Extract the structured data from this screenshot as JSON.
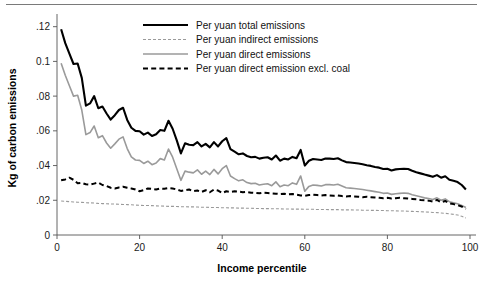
{
  "figure": {
    "has_top_rule": true,
    "background": "#ffffff"
  },
  "chart_data": {
    "type": "line",
    "title": "",
    "xlabel": "Income percentile",
    "ylabel": "Kg of carbon emissions",
    "xlim": [
      0,
      100
    ],
    "ylim": [
      0,
      0.125
    ],
    "grid": false,
    "legend_position": "top-center",
    "xticks": [
      0,
      20,
      40,
      60,
      80,
      100
    ],
    "xtick_labels": [
      "0",
      "20",
      "40",
      "60",
      "80",
      "100"
    ],
    "yticks": [
      0,
      0.02,
      0.04,
      0.06,
      0.08,
      0.1,
      0.12
    ],
    "ytick_labels": [
      "0",
      ".02",
      ".04",
      ".06",
      ".08",
      "0.1",
      ".12"
    ],
    "x": [
      1,
      2,
      3,
      4,
      5,
      6,
      7,
      8,
      9,
      10,
      11,
      12,
      13,
      14,
      15,
      16,
      17,
      18,
      19,
      20,
      21,
      22,
      23,
      24,
      25,
      26,
      27,
      28,
      29,
      30,
      31,
      32,
      33,
      34,
      35,
      36,
      37,
      38,
      39,
      40,
      41,
      42,
      43,
      44,
      45,
      46,
      47,
      48,
      49,
      50,
      51,
      52,
      53,
      54,
      55,
      56,
      57,
      58,
      59,
      60,
      61,
      62,
      63,
      64,
      65,
      66,
      67,
      68,
      69,
      70,
      71,
      72,
      73,
      74,
      75,
      76,
      77,
      78,
      79,
      80,
      81,
      82,
      83,
      84,
      85,
      86,
      87,
      88,
      89,
      90,
      91,
      92,
      93,
      94,
      95,
      96,
      97,
      98,
      99
    ],
    "series": [
      {
        "name": "Per yuan total emissions",
        "color": "#000000",
        "style": "solid",
        "width": 2.1,
        "values": [
          0.1185,
          0.1105,
          0.1045,
          0.0985,
          0.0988,
          0.0905,
          0.0745,
          0.0758,
          0.08,
          0.073,
          0.074,
          0.07,
          0.0665,
          0.069,
          0.072,
          0.0733,
          0.0663,
          0.0618,
          0.06,
          0.0598,
          0.0578,
          0.059,
          0.057,
          0.058,
          0.0605,
          0.06,
          0.0658,
          0.0612,
          0.0545,
          0.047,
          0.0528,
          0.052,
          0.0518,
          0.0535,
          0.051,
          0.0525,
          0.0505,
          0.0535,
          0.051,
          0.054,
          0.0558,
          0.0495,
          0.048,
          0.0465,
          0.047,
          0.0455,
          0.0448,
          0.045,
          0.044,
          0.0445,
          0.0448,
          0.0435,
          0.0458,
          0.0428,
          0.044,
          0.0435,
          0.045,
          0.0442,
          0.049,
          0.04,
          0.0428,
          0.0438,
          0.0435,
          0.0432,
          0.044,
          0.044,
          0.0438,
          0.0442,
          0.043,
          0.042,
          0.0418,
          0.0415,
          0.0412,
          0.0408,
          0.0402,
          0.0398,
          0.0392,
          0.0388,
          0.038,
          0.0382,
          0.0372,
          0.0378,
          0.038,
          0.0382,
          0.038,
          0.037,
          0.0362,
          0.0355,
          0.0348,
          0.0342,
          0.0335,
          0.0345,
          0.033,
          0.0338,
          0.0318,
          0.0312,
          0.0305,
          0.0288,
          0.0262
        ]
      },
      {
        "name": "Per yuan indirect emissions",
        "color": "#9a9a9a",
        "style": "fine-dash",
        "width": 1.1,
        "values": [
          0.0196,
          0.0194,
          0.0192,
          0.019,
          0.0189,
          0.0188,
          0.0186,
          0.0185,
          0.0184,
          0.0182,
          0.0181,
          0.018,
          0.0179,
          0.0178,
          0.0177,
          0.0176,
          0.0175,
          0.0174,
          0.0172,
          0.0171,
          0.017,
          0.017,
          0.0169,
          0.0168,
          0.0167,
          0.0166,
          0.0165,
          0.0165,
          0.0164,
          0.0163,
          0.0163,
          0.0162,
          0.0162,
          0.0161,
          0.016,
          0.016,
          0.0159,
          0.0158,
          0.0158,
          0.0157,
          0.0157,
          0.0156,
          0.0156,
          0.0155,
          0.0155,
          0.0154,
          0.0154,
          0.0153,
          0.0153,
          0.0152,
          0.0152,
          0.0151,
          0.0151,
          0.0151,
          0.015,
          0.015,
          0.0149,
          0.0149,
          0.0149,
          0.0148,
          0.0148,
          0.0148,
          0.0147,
          0.0147,
          0.0147,
          0.0146,
          0.0146,
          0.0146,
          0.0145,
          0.0145,
          0.0145,
          0.0144,
          0.0144,
          0.0143,
          0.0143,
          0.0142,
          0.0142,
          0.0141,
          0.0141,
          0.014,
          0.014,
          0.0139,
          0.0138,
          0.0138,
          0.0137,
          0.0136,
          0.0135,
          0.0134,
          0.0133,
          0.0132,
          0.013,
          0.0129,
          0.0127,
          0.0125,
          0.0122,
          0.0119,
          0.0115,
          0.0108,
          0.0098
        ]
      },
      {
        "name": "Per yuan direct emissions",
        "color": "#9a9a9a",
        "style": "solid",
        "width": 1.6,
        "values": [
          0.099,
          0.092,
          0.086,
          0.08,
          0.0805,
          0.072,
          0.0578,
          0.059,
          0.0628,
          0.056,
          0.0572,
          0.053,
          0.05,
          0.0525,
          0.0552,
          0.0565,
          0.0498,
          0.045,
          0.0432,
          0.043,
          0.0412,
          0.0425,
          0.0405,
          0.0415,
          0.044,
          0.0432,
          0.0495,
          0.0448,
          0.0382,
          0.0315,
          0.0368,
          0.0362,
          0.0358,
          0.0375,
          0.035,
          0.0368,
          0.0348,
          0.0378,
          0.0352,
          0.0382,
          0.04,
          0.034,
          0.0325,
          0.0312,
          0.0318,
          0.0302,
          0.0296,
          0.0298,
          0.0288,
          0.0292,
          0.0295,
          0.0284,
          0.0306,
          0.0278,
          0.0288,
          0.0284,
          0.03,
          0.0292,
          0.034,
          0.0252,
          0.028,
          0.0288,
          0.0286,
          0.0282,
          0.029,
          0.029,
          0.0288,
          0.0292,
          0.0282,
          0.0272,
          0.027,
          0.0268,
          0.0265,
          0.0262,
          0.0258,
          0.0254,
          0.025,
          0.0246,
          0.024,
          0.0242,
          0.0234,
          0.0238,
          0.024,
          0.0242,
          0.024,
          0.0232,
          0.0226,
          0.022,
          0.0214,
          0.021,
          0.0204,
          0.0214,
          0.02,
          0.0208,
          0.0192,
          0.0186,
          0.018,
          0.017,
          0.0158
        ]
      },
      {
        "name": "Per yuan direct emission excl. coal",
        "color": "#000000",
        "style": "bold-dash",
        "width": 2.0,
        "values": [
          0.0315,
          0.032,
          0.033,
          0.0318,
          0.0298,
          0.03,
          0.0292,
          0.029,
          0.0296,
          0.0302,
          0.0288,
          0.0282,
          0.0272,
          0.0268,
          0.0274,
          0.0278,
          0.0272,
          0.0268,
          0.0262,
          0.0252,
          0.0258,
          0.0268,
          0.0266,
          0.0262,
          0.0268,
          0.0266,
          0.027,
          0.0268,
          0.0262,
          0.0254,
          0.0258,
          0.0262,
          0.0252,
          0.0256,
          0.0248,
          0.0258,
          0.0246,
          0.0262,
          0.0256,
          0.0242,
          0.0252,
          0.0248,
          0.0252,
          0.025,
          0.0246,
          0.0248,
          0.0244,
          0.0242,
          0.024,
          0.0244,
          0.0242,
          0.024,
          0.0238,
          0.0236,
          0.0238,
          0.0234,
          0.0236,
          0.0232,
          0.0228,
          0.0226,
          0.023,
          0.0232,
          0.023,
          0.0228,
          0.023,
          0.0228,
          0.0226,
          0.0228,
          0.0224,
          0.0222,
          0.0224,
          0.0222,
          0.022,
          0.0218,
          0.022,
          0.0218,
          0.0216,
          0.0214,
          0.0212,
          0.0214,
          0.021,
          0.0212,
          0.0214,
          0.0212,
          0.021,
          0.0208,
          0.0206,
          0.0202,
          0.02,
          0.0198,
          0.0192,
          0.0202,
          0.0188,
          0.0196,
          0.0182,
          0.0178,
          0.0172,
          0.0164,
          0.015
        ]
      }
    ]
  },
  "legend": {
    "items": [
      {
        "label": "Per yuan total emissions"
      },
      {
        "label": "Per yuan indirect emissions"
      },
      {
        "label": "Per yuan direct emissions"
      },
      {
        "label": "Per yuan direct emission excl. coal"
      }
    ]
  }
}
